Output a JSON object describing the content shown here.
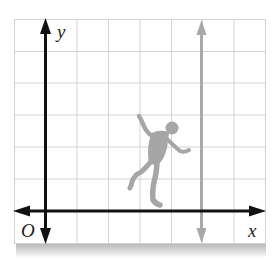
{
  "diagram": {
    "type": "coordinate-plane",
    "axes": {
      "x_label": "x",
      "y_label": "y",
      "origin_label": "O"
    },
    "grid": {
      "columns": 8,
      "rows": 7,
      "line_color": "#d0d0d0",
      "x_axis_row_from_top": 6,
      "y_axis_column_from_left": 1
    },
    "vertical_line": {
      "description": "gray vertical line with arrows at both ends",
      "column_from_y_axis": 5,
      "color": "#a8a8a8"
    },
    "figure": {
      "description": "gray silhouette of a person in mid-step/dancing pose",
      "color": "#a6a6a6",
      "position": "between y-axis and vertical line, above x-axis"
    },
    "colors": {
      "axis": "#111111",
      "background": "#ffffff",
      "shadow": "#c8c8c8"
    }
  }
}
